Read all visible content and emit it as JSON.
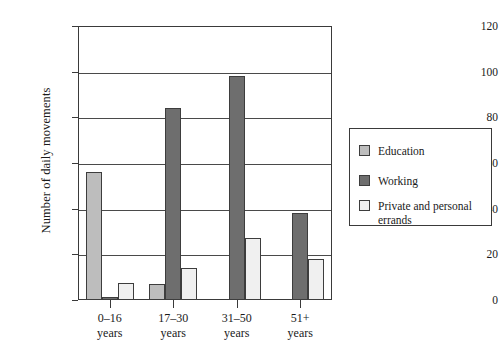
{
  "chart_data": {
    "type": "bar",
    "title": "",
    "subtitle": "",
    "xlabel": "",
    "ylabel": "Number of daily movements",
    "categories": [
      "0–16\nyears",
      "17–30\nyears",
      "31–50\nyears",
      "51+\nyears"
    ],
    "category_lines": [
      [
        "0–16",
        "years"
      ],
      [
        "17–30",
        "years"
      ],
      [
        "31–50",
        "years"
      ],
      [
        "51+",
        "years"
      ]
    ],
    "series": [
      {
        "name": "Education",
        "color": "#bdbdbd",
        "values": [
          56,
          7,
          0,
          0
        ]
      },
      {
        "name": "Working",
        "color": "#6e6e6e",
        "values": [
          1.5,
          84,
          98,
          38
        ]
      },
      {
        "name": "Private and personal\nerrands",
        "color": "#f0f0f0",
        "values": [
          7.5,
          14,
          27,
          18
        ]
      }
    ],
    "ylim": [
      0,
      120
    ],
    "yticks": [
      0,
      20,
      40,
      60,
      80,
      100,
      120
    ],
    "ytick_labels": [
      "0",
      "20",
      "40",
      "60",
      "80",
      "100",
      "120"
    ],
    "grid": true,
    "grid_axis": "y",
    "legend_position": "right",
    "legend_entries": [
      {
        "label": "Education",
        "color": "#bdbdbd"
      },
      {
        "label": "Working",
        "color": "#6e6e6e"
      },
      {
        "label": "Private and personal\nerrands",
        "color": "#f0f0f0"
      }
    ]
  }
}
